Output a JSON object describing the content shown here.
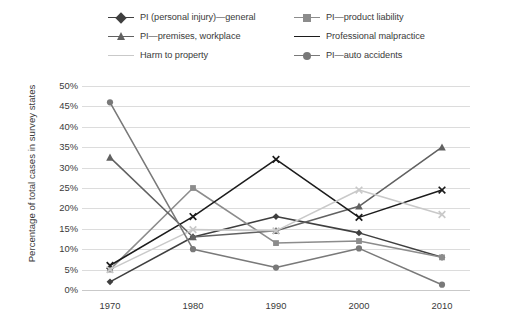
{
  "chart_data": {
    "type": "line",
    "title": "",
    "xlabel": "",
    "ylabel": "Percentage of total cases in survey states",
    "x": [
      "1970",
      "1980",
      "1990",
      "2000",
      "2010"
    ],
    "categories": [
      "1970",
      "1980",
      "1990",
      "2000",
      "2010"
    ],
    "ylim": [
      0,
      50
    ],
    "ytick_labels": [
      "50%",
      "45%",
      "40%",
      "35%",
      "30%",
      "25%",
      "20%",
      "15%",
      "10%",
      "5%",
      "0%"
    ],
    "ytick_values": [
      50,
      45,
      40,
      35,
      30,
      25,
      20,
      15,
      10,
      5,
      0
    ],
    "grid": true,
    "legend_position": "top",
    "series": [
      {
        "name": "PI (personal injury)—general",
        "marker": "diamond",
        "color": "#3f3f3f",
        "values": [
          2.0,
          13.0,
          18.0,
          14.0,
          8.0
        ]
      },
      {
        "name": "PI—product liability",
        "marker": "square",
        "color": "#8c8c8c",
        "values": [
          5.0,
          25.0,
          11.5,
          12.0,
          8.0
        ]
      },
      {
        "name": "PI—premises, workplace",
        "marker": "triangle",
        "color": "#616161",
        "values": [
          32.5,
          13.0,
          14.5,
          20.5,
          35.0
        ]
      },
      {
        "name": "Professional malpractice",
        "marker": "x",
        "color": "#1c1c1c",
        "values": [
          6.0,
          18.0,
          32.0,
          17.8,
          24.5
        ]
      },
      {
        "name": "Harm to property",
        "marker": "x",
        "color": "#c9c9c9",
        "values": [
          5.0,
          14.8,
          14.5,
          24.5,
          18.5
        ]
      },
      {
        "name": "PI—auto accidents",
        "marker": "circle",
        "color": "#797979",
        "values": [
          46.0,
          10.0,
          5.5,
          10.2,
          1.3
        ]
      }
    ]
  },
  "legend": {
    "items": [
      {
        "label": "PI (personal injury)—general",
        "marker": "diamond",
        "color": "#3f3f3f"
      },
      {
        "label": "PI—product liability",
        "marker": "square",
        "color": "#8c8c8c"
      },
      {
        "label": "PI—premises, workplace",
        "marker": "triangle",
        "color": "#616161"
      },
      {
        "label": "Professional malpractice",
        "marker": "x",
        "color": "#1c1c1c"
      },
      {
        "label": "Harm to property",
        "marker": "x",
        "color": "#c9c9c9"
      },
      {
        "label": "PI—auto accidents",
        "marker": "circle",
        "color": "#797979"
      }
    ]
  }
}
